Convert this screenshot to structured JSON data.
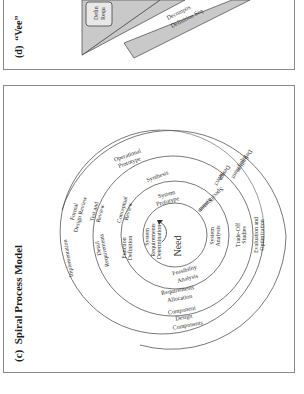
{
  "figure_d": {
    "label": "(d)",
    "title": "“Vee”",
    "box_text": [
      "Defin",
      "Requ"
    ],
    "band_text": [
      "Decompos",
      "Definition Seq"
    ]
  },
  "figure_c": {
    "label": "(c)",
    "title": "Spiral Process Model",
    "center": "Need",
    "ring1": {
      "system_requirements_determination": [
        "System",
        "Requirements",
        "Determination"
      ],
      "feasibility_analysis": [
        "Feasibility",
        "Analysis"
      ],
      "system_analysis": [
        "System",
        "Analysis"
      ],
      "system_specification": [
        "System",
        "Specification"
      ],
      "system_prototype": [
        "System",
        "Prototype"
      ],
      "function_definition": [
        "Function",
        "Definition"
      ]
    },
    "ring2": {
      "conceptual_review": [
        "Conceptual",
        "Review"
      ],
      "requirements_allocation": [
        "Requirements",
        "Allocation"
      ],
      "trade_off_studies": [
        "Trade-Off",
        "Studies"
      ],
      "select_design": [
        "Select",
        "Design"
      ],
      "synthesis": "Synthesis",
      "detail_requirements": [
        "Detail",
        "Requirements"
      ]
    },
    "ring3": {
      "test_and_review": [
        "Test and",
        "Review"
      ],
      "component_design": [
        "Component",
        "Design"
      ],
      "evaluation_and_optimization": [
        "Evaluation and",
        "Optimization"
      ],
      "equipment_definition": [
        "Equipment",
        "Definition"
      ],
      "operational_prototype": [
        "Operational",
        "Prototype"
      ],
      "formal_design_review": [
        "Formal",
        "Design Review"
      ]
    },
    "outer": {
      "components": "Components",
      "implementation": "Implementation"
    }
  }
}
